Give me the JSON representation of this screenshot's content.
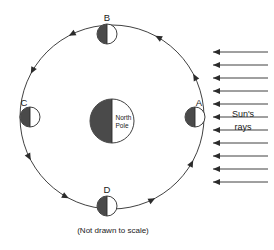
{
  "figure": {
    "caption": "(Not drawn to scale)",
    "sun_rays_label_line1": "Sun's",
    "sun_rays_label_line2": "rays",
    "center_label_line1": "North",
    "center_label_line2": "Pole",
    "colors": {
      "line": "#2b2b2b",
      "shadow_fill": "#4a4a4a",
      "lit_fill": "#ffffff",
      "background": "#ffffff",
      "text": "#1a1a1a"
    }
  },
  "center_body": {
    "name": "north-pole-body",
    "label_line1": "North",
    "label_line2": "Pole",
    "cx": 112,
    "cy": 121,
    "r": 22,
    "dark_side": "left"
  },
  "orbit": {
    "cx": 112,
    "cy": 117,
    "r": 92,
    "direction": "counterclockwise",
    "arrowhead_count": 8
  },
  "positions": [
    {
      "id": "A",
      "label": "A",
      "cx": 195,
      "cy": 117,
      "r": 10,
      "dark_side": "left",
      "label_dx": 4,
      "label_dy": -11
    },
    {
      "id": "B",
      "label": "B",
      "cx": 107,
      "cy": 34,
      "r": 10,
      "dark_side": "left",
      "label_dx": 0,
      "label_dy": -13
    },
    {
      "id": "C",
      "label": "C",
      "cx": 30,
      "cy": 117,
      "r": 10,
      "dark_side": "left",
      "label_dx": -6,
      "label_dy": -11
    },
    {
      "id": "D",
      "label": "D",
      "cx": 107,
      "cy": 206,
      "r": 10,
      "dark_side": "left",
      "label_dx": 0,
      "label_dy": -13
    }
  ],
  "sun_rays": {
    "label_line1": "Sun's",
    "label_line2": "rays",
    "label_x": 243,
    "label_y1": 117,
    "label_y2": 130,
    "x_start": 268,
    "x_end": 213,
    "direction": "leftward",
    "count": 11,
    "y_values": [
      52,
      65,
      78,
      91,
      104,
      117,
      130,
      143,
      156,
      169,
      182
    ]
  },
  "caption": {
    "text": "(Not drawn to scale)",
    "x": 113,
    "y": 233
  }
}
